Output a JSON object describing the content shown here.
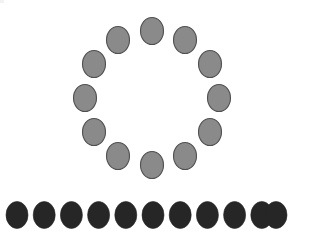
{
  "canvas": {
    "width": 312,
    "height": 251,
    "background_color": "#ffffff",
    "description": "White blank canvas containing a ring of grey ovals above a horizontal row of black ovals"
  },
  "corner_artifact": {
    "label": "clipped rounded widget fragment",
    "visible": true,
    "x": -6,
    "y": -7,
    "rx": 11,
    "ry": 10,
    "outline_color": "#d9d9d9",
    "fill_color": "#f2f2f2"
  },
  "ring_group": {
    "label": "Circular arrangement of grey ovals",
    "count": 12,
    "center_x": 152,
    "center_y": 98,
    "radius": 67,
    "start_angle_deg": -90,
    "angle_step_deg": 30,
    "ellipse_rx": 11.5,
    "ellipse_ry": 13.5,
    "fill_color": "#8a8a8a",
    "stroke_color": "#4f4f4f",
    "items": [
      {
        "index": 1,
        "angle_deg": -90,
        "cx": 152,
        "cy": 31
      },
      {
        "index": 2,
        "angle_deg": -60,
        "cx": 185,
        "cy": 40
      },
      {
        "index": 3,
        "angle_deg": -30,
        "cx": 210,
        "cy": 64
      },
      {
        "index": 4,
        "angle_deg": 0,
        "cx": 219,
        "cy": 98
      },
      {
        "index": 5,
        "angle_deg": 30,
        "cx": 210,
        "cy": 132
      },
      {
        "index": 6,
        "angle_deg": 60,
        "cx": 185,
        "cy": 156
      },
      {
        "index": 7,
        "angle_deg": 90,
        "cx": 152,
        "cy": 165
      },
      {
        "index": 8,
        "angle_deg": 120,
        "cx": 118,
        "cy": 156
      },
      {
        "index": 9,
        "angle_deg": 150,
        "cx": 94,
        "cy": 132
      },
      {
        "index": 10,
        "angle_deg": 180,
        "cx": 85,
        "cy": 98
      },
      {
        "index": 11,
        "angle_deg": 210,
        "cx": 94,
        "cy": 64
      },
      {
        "index": 12,
        "angle_deg": 240,
        "cx": 118,
        "cy": 40
      }
    ]
  },
  "row_group": {
    "label": "Horizontal row of black ovals",
    "count": 11,
    "start_x": 17,
    "spacing_x": 27.2,
    "center_y": 215,
    "ellipse_rx": 11,
    "ellipse_ry": 13.5,
    "fill_color": "#262626",
    "items": [
      {
        "index": 1,
        "cx": 17.0,
        "cy": 215
      },
      {
        "index": 2,
        "cx": 44.2,
        "cy": 215
      },
      {
        "index": 3,
        "cx": 71.4,
        "cy": 215
      },
      {
        "index": 4,
        "cx": 98.6,
        "cy": 215
      },
      {
        "index": 5,
        "cx": 125.8,
        "cy": 215
      },
      {
        "index": 6,
        "cx": 153.0,
        "cy": 215
      },
      {
        "index": 7,
        "cx": 180.2,
        "cy": 215
      },
      {
        "index": 8,
        "cx": 207.4,
        "cy": 215
      },
      {
        "index": 9,
        "cx": 234.6,
        "cy": 215
      },
      {
        "index": 10,
        "cx": 261.8,
        "cy": 215
      },
      {
        "index": 11,
        "cx": 276.0,
        "cy": 215
      }
    ]
  }
}
